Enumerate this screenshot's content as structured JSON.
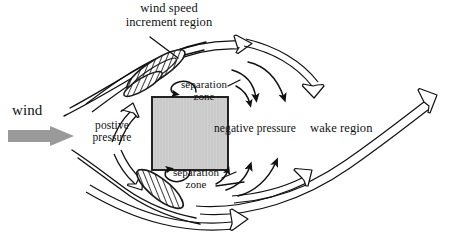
{
  "figure": {
    "kind": "airflow-diagram"
  },
  "labels": {
    "title": "wind speed\nincrement region",
    "wind": "wind",
    "positive_pressure": "postive\npressure",
    "negative_pressure": "negative pressure",
    "wake_region": "wake region",
    "separation_zone_top": "separation\nzone",
    "separation_zone_bottom": "separation\nzone"
  },
  "colors": {
    "ink": "#111111",
    "building_fill": "#c9c9c9",
    "building_stroke": "#1a1a1a",
    "wind_arrow_fill": "#9a9a9a",
    "hatch_stroke": "#1a1a1a",
    "background": "#ffffff"
  },
  "elements": {
    "building": {
      "name": "building-block",
      "x": 152,
      "y": 97,
      "width": 76,
      "height": 73
    },
    "wind_arrow": {
      "name": "wind-direction-arrow",
      "x": 8,
      "y": 126,
      "width": 66,
      "height": 20
    },
    "increment_region": {
      "name": "wind-speed-increment-region",
      "shape": "tilted-lens",
      "angle_deg": -33
    },
    "separation_wedge_top": {
      "name": "separation-wedge-top",
      "shape": "tilted-lens",
      "angle_deg": -33
    },
    "separation_wedge_bottom": {
      "name": "separation-wedge-bottom",
      "shape": "teardrop",
      "angle_deg": 38
    },
    "streamline_count_upper": 4,
    "streamline_count_lower": 4,
    "recirculation_arrow_count": 2
  }
}
